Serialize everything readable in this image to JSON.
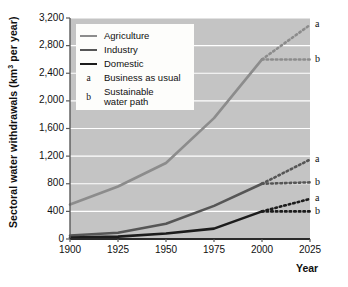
{
  "chart_data": {
    "type": "line",
    "title": "",
    "xlabel": "Year",
    "ylabel": "Sectoral water withdrawals (km3 per year)",
    "ylabel_prefix": "Sectoral water withdrawals (km",
    "ylabel_superscript": "3",
    "ylabel_suffix": " per year)",
    "x": [
      1900,
      1925,
      1950,
      1975,
      2000
    ],
    "xlim": [
      1900,
      2025
    ],
    "ylim": [
      0,
      3200
    ],
    "xticks": [
      "1900",
      "1925",
      "1950",
      "1975",
      "2000",
      "2025"
    ],
    "xtick_values": [
      1900,
      1925,
      1950,
      1975,
      2000,
      2025
    ],
    "yticks": [
      "0",
      "400",
      "800",
      "1,200",
      "1,600",
      "2,000",
      "2,400",
      "2,800",
      "3,200"
    ],
    "ytick_values": [
      0,
      400,
      800,
      1200,
      1600,
      2000,
      2400,
      2800,
      3200
    ],
    "grid": true,
    "grid_color": "#ffffff",
    "plot_background": "#c4c4c4",
    "legend_position": "upper left",
    "series": [
      {
        "name": "Agriculture",
        "color": "#8c8c8c",
        "width": 2.6,
        "values": [
          500,
          760,
          1100,
          1750,
          2600
        ],
        "projections": [
          {
            "key": "a",
            "label": "Business as usual",
            "values": [
              2600,
              3100
            ],
            "x": [
              2000,
              2025
            ]
          },
          {
            "key": "b",
            "label": "Sustainable water path",
            "values": [
              2600,
              2600
            ],
            "x": [
              2000,
              2025
            ]
          }
        ]
      },
      {
        "name": "Industry",
        "color": "#565656",
        "width": 2.6,
        "values": [
          50,
          90,
          220,
          480,
          800
        ],
        "projections": [
          {
            "key": "a",
            "label": "Business as usual",
            "values": [
              800,
              1150
            ],
            "x": [
              2000,
              2025
            ]
          },
          {
            "key": "b",
            "label": "Sustainable water path",
            "values": [
              800,
              820
            ],
            "x": [
              2000,
              2025
            ]
          }
        ]
      },
      {
        "name": "Domestic",
        "color": "#1c1c1c",
        "width": 2.6,
        "values": [
          20,
          35,
          80,
          150,
          400
        ],
        "projections": [
          {
            "key": "a",
            "label": "Business as usual",
            "values": [
              400,
              580
            ],
            "x": [
              2000,
              2025
            ]
          },
          {
            "key": "b",
            "label": "Sustainable water path",
            "values": [
              400,
              400
            ],
            "x": [
              2000,
              2025
            ]
          }
        ]
      }
    ],
    "annotations": [
      {
        "key": "a",
        "value": 3100,
        "series": "Agriculture"
      },
      {
        "key": "b",
        "value": 2600,
        "series": "Agriculture"
      },
      {
        "key": "a",
        "value": 1150,
        "series": "Industry"
      },
      {
        "key": "b",
        "value": 820,
        "series": "Industry"
      },
      {
        "key": "a",
        "value": 580,
        "series": "Domestic"
      },
      {
        "key": "b",
        "value": 400,
        "series": "Domestic"
      }
    ]
  },
  "legend": {
    "entries": [
      {
        "kind": "line",
        "label": "Agriculture",
        "color": "#8c8c8c"
      },
      {
        "kind": "line",
        "label": "Industry",
        "color": "#565656"
      },
      {
        "kind": "line",
        "label": "Domestic",
        "color": "#1c1c1c"
      },
      {
        "kind": "key",
        "key": "a",
        "label": "Business as usual"
      },
      {
        "kind": "key",
        "key": "b",
        "label_line1": "Sustainable",
        "label_line2": "water path"
      }
    ]
  }
}
